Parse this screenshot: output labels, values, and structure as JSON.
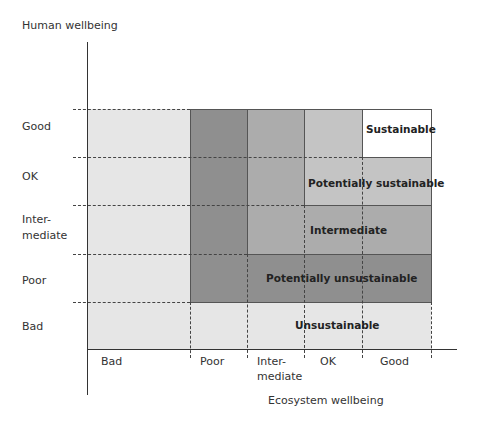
{
  "y_axis": {
    "title": "Human wellbeing",
    "levels": [
      "Good",
      "OK",
      "Inter-\nmediate",
      "Poor",
      "Bad"
    ],
    "level_lines": [
      "Good",
      "OK",
      "Inter-",
      "mediate",
      "Poor",
      "Bad"
    ]
  },
  "x_axis": {
    "title": "Ecosystem wellbeing",
    "levels": [
      "Bad",
      "Poor",
      "Inter-\nmediate",
      "OK",
      "Good"
    ],
    "level_lines": [
      "Bad",
      "Poor",
      "Inter-",
      "mediate",
      "OK",
      "Good"
    ]
  },
  "zones": [
    {
      "name": "Sustainable",
      "color": "#ffffff"
    },
    {
      "name": "Potentially sustainable",
      "color": "#c4c4c4"
    },
    {
      "name": "Intermediate",
      "color": "#b0b0b0"
    },
    {
      "name": "Potentially unsustainable",
      "color": "#8f8f8f"
    },
    {
      "name": "Unsustainable",
      "color": "#e6e6e6"
    }
  ],
  "column_colors": {
    "bad": "#e6e6e6",
    "poor": "#8f8f8f",
    "intermediate": "#acacac",
    "ok": "#c4c4c4"
  }
}
